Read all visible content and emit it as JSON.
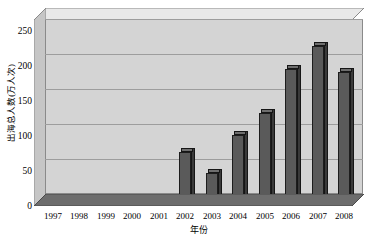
{
  "chart_data": {
    "type": "bar",
    "title": "",
    "xlabel": "年份",
    "ylabel": "出海总人数(万人次)",
    "categories": [
      "1997",
      "1998",
      "1999",
      "2000",
      "2001",
      "2002",
      "2003",
      "2004",
      "2005",
      "2006",
      "2007",
      "2008"
    ],
    "values": [
      6,
      7,
      9,
      10,
      11,
      77,
      47,
      101,
      133,
      196,
      228,
      192
    ],
    "ylim": [
      0,
      250
    ],
    "yticks": [
      "0",
      "50",
      "100",
      "150",
      "200",
      "250"
    ],
    "ytick_values": [
      0,
      50,
      100,
      150,
      200,
      250
    ],
    "grid": true,
    "legend": "none",
    "style": "3d-column",
    "series_color": "#5a5a5a",
    "plot_background": "#d4d4d4",
    "gridline_color": "#9d9d9d"
  },
  "axes": {
    "y_title": "出海总人数(万人次)",
    "x_title": "年份"
  }
}
